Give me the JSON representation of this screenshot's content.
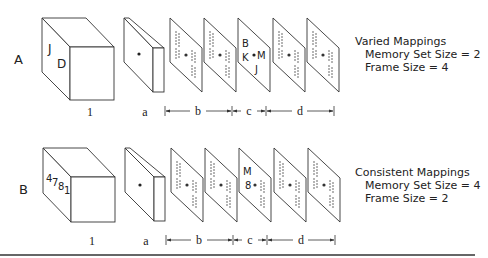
{
  "rows": [
    {
      "row_label": "A",
      "box_letters": [
        "J",
        "D"
      ],
      "frame_c_letters": [
        "B",
        "K",
        "M",
        "J"
      ],
      "caption": {
        "title": "Varied Mappings",
        "memory_set": "Memory Set Size = 2",
        "frame_size": "Frame Size = 4"
      }
    },
    {
      "row_label": "B",
      "box_letters": [
        "4",
        "7",
        "8",
        "1"
      ],
      "frame_c_letters": [
        "M",
        "8"
      ],
      "caption": {
        "title": "Consistent Mappings",
        "memory_set": "Memory Set Size = 4",
        "frame_size": "Frame Size = 2"
      }
    }
  ],
  "stage_labels": {
    "memory": "1",
    "fixation": "a",
    "pre_target": "b",
    "target": "c",
    "post_target": "d"
  },
  "colors": {
    "line": "#333333",
    "background": "#ffffff"
  }
}
